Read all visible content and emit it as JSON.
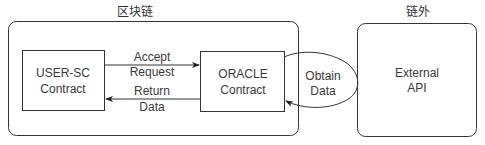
{
  "diagram": {
    "regions": [
      {
        "id": "blockchain",
        "label": "区块链"
      },
      {
        "id": "offchain",
        "label": "链外"
      }
    ],
    "nodes": {
      "user_sc": {
        "line1": "USER-SC",
        "line2": "Contract"
      },
      "oracle": {
        "line1": "ORACLE",
        "line2": "Contract"
      },
      "external_api": {
        "line1": "External",
        "line2": "API"
      }
    },
    "edges": {
      "accept_request": {
        "line1": "Accept",
        "line2": "Request",
        "from": "USER-SC Contract",
        "to": "ORACLE Contract"
      },
      "return_data": {
        "line1": "Return",
        "line2": "Data",
        "from": "ORACLE Contract",
        "to": "USER-SC Contract"
      },
      "obtain_data": {
        "line1": "Obtain",
        "line2": "Data",
        "from": "External API",
        "to": "ORACLE Contract"
      }
    },
    "colors": {
      "stroke": "#333333",
      "text": "#3a3a3a",
      "background": "#ffffff"
    }
  }
}
